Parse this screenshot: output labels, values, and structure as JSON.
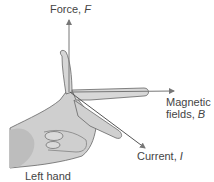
{
  "diagram": {
    "labels": {
      "force": "Force,",
      "force_symbol": "F",
      "magnetic_line1": "Magnetic",
      "magnetic_line2": "fields,",
      "magnetic_symbol": "B",
      "current": "Current,",
      "current_symbol": "I",
      "hand": "Left hand"
    },
    "colors": {
      "hand_fill": "#d4d4d4",
      "hand_shadow": "#b8b8b8",
      "outline": "#555555",
      "arrow": "#777777",
      "text": "#444444"
    }
  }
}
